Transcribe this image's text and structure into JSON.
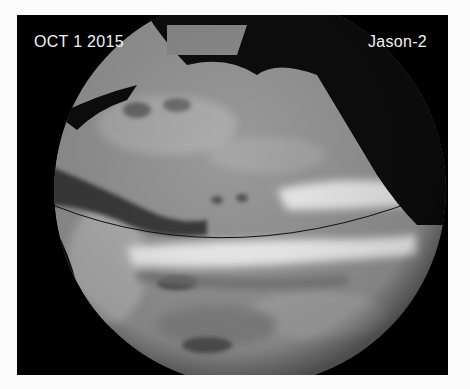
{
  "image": {
    "date_label": "OCT 1 2015",
    "satellite_label": "Jason-2",
    "subject": "Pacific Ocean sea surface height anomaly on globe",
    "colors": {
      "background": "#000000",
      "ocean_base": "#9a9a9a",
      "high_anomaly": "#f4f4f4",
      "low_anomaly": "#3a3a3a",
      "land": "#0e0e0e",
      "text": "#f2f2f2"
    }
  }
}
